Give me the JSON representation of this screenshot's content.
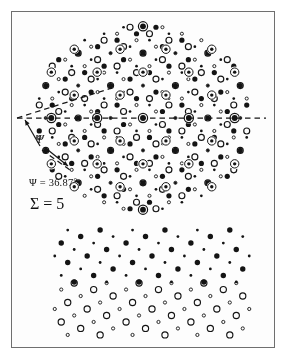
{
  "figure": {
    "background": "#fdfdfd",
    "frame_color": "#6f6f6f",
    "ink_color": "#141414",
    "labels": {
      "psi_value": "Ψ = 36.87°",
      "sigma_value": "Σ = 5",
      "psi_symbol": "Ψ"
    }
  },
  "chart_data": {
    "type": "scatter",
    "xlabel": "",
    "ylabel": "",
    "xlim": [
      0,
      288
    ],
    "ylim": [
      0,
      359
    ],
    "grid": false,
    "legend": "none",
    "annotations": [
      {
        "name": "psi-value",
        "text": "Ψ = 36.87°",
        "x": 29,
        "y": 182
      },
      {
        "name": "sigma-value",
        "text": "Σ = 5",
        "x": 30,
        "y": 203
      },
      {
        "name": "psi-symbol",
        "text": "Ψ",
        "x": 38,
        "y": 140
      }
    ],
    "rotation_angle_deg": 36.87,
    "sigma": 5,
    "lattice_spacing_px": 20.5,
    "series": [
      {
        "name": "lattice-A-large-filled",
        "marker": "filled-circle",
        "size_px": 5.2,
        "color": "#141414"
      },
      {
        "name": "lattice-A-small-filled",
        "marker": "filled-circle",
        "size_px": 2.6,
        "color": "#141414"
      },
      {
        "name": "lattice-B-large-open",
        "marker": "open-circle",
        "size_px": 6.0,
        "color": "#141414"
      },
      {
        "name": "lattice-B-small-open",
        "marker": "open-circle",
        "size_px": 3.0,
        "color": "#141414"
      },
      {
        "name": "coincidence-sites",
        "marker": "bullseye",
        "size_px": 9.0,
        "color": "#141414"
      }
    ],
    "panels": [
      {
        "name": "overlap-panel",
        "region": [
          30,
          22,
          250,
          215
        ],
        "description": "Two square lattices superposed and rotated by 36.87 degrees, coincidence sites ringed"
      },
      {
        "name": "lattice-A-panel",
        "region": [
          55,
          232,
          250,
          282
        ],
        "description": "Filled-circle square lattice alone"
      },
      {
        "name": "lattice-B-panel",
        "region": [
          55,
          282,
          250,
          338
        ],
        "description": "Open-circle square lattice alone"
      }
    ],
    "guide_lines": [
      {
        "name": "reference-axis-dashed",
        "x1": 17,
        "y1": 118,
        "x2": 266,
        "y2": 118,
        "style": "dashed"
      },
      {
        "name": "rotated-axis-dashed",
        "x1": 17,
        "y1": 118,
        "x2": 112,
        "y2": 88,
        "style": "dashed"
      },
      {
        "name": "angle-leader-dashed",
        "x1": 42,
        "y1": 150,
        "x2": 70,
        "y2": 170,
        "style": "dashed"
      }
    ]
  }
}
